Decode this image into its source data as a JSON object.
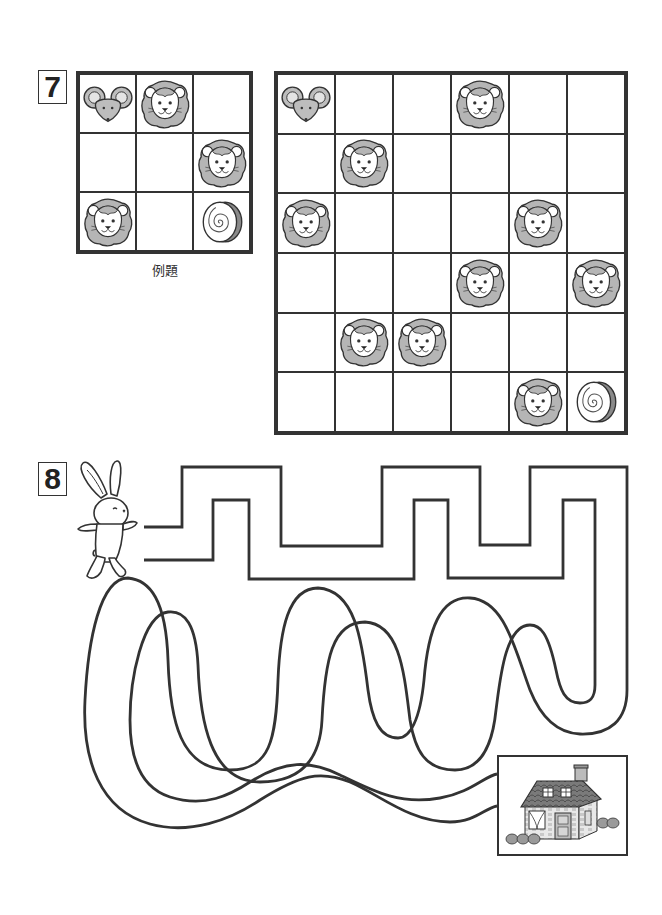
{
  "problem7": {
    "number": "7",
    "example_caption": "例題",
    "example_grid": {
      "rows": 3,
      "cols": 3,
      "cells": [
        [
          "mouse",
          "lion",
          ""
        ],
        [
          "",
          "",
          "lion"
        ],
        [
          "lion",
          "",
          "cake-roll"
        ]
      ]
    },
    "puzzle_grid": {
      "rows": 6,
      "cols": 6,
      "cells": [
        [
          "mouse",
          "",
          "",
          "lion",
          "",
          ""
        ],
        [
          "",
          "lion",
          "",
          "",
          "",
          ""
        ],
        [
          "lion",
          "",
          "",
          "",
          "lion",
          ""
        ],
        [
          "",
          "",
          "",
          "lion",
          "",
          "lion"
        ],
        [
          "",
          "lion",
          "lion",
          "",
          "",
          ""
        ],
        [
          "",
          "",
          "",
          "",
          "lion",
          "cake-roll"
        ]
      ]
    }
  },
  "problem8": {
    "number": "8",
    "start_character": "rabbit-icon",
    "goal": "house-icon"
  },
  "colors": {
    "line": "#333333",
    "mane": "#b5b5b5",
    "mouse": "#bdbdbd",
    "background": "#ffffff"
  }
}
